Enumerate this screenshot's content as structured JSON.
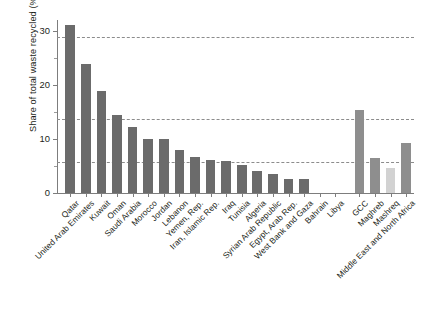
{
  "chart": {
    "type": "bar",
    "title": "",
    "xlabel": "",
    "ylabel": "Share of total waste recycled (%)",
    "ylim": [
      0,
      32
    ],
    "yticks": [
      "0",
      "10",
      "20",
      "30"
    ],
    "ytick_values": [
      0,
      10,
      20,
      30
    ],
    "ytick_minor_values": [
      5,
      15,
      25
    ],
    "grid": "horizontal-dashed",
    "gridline_values": [
      5.8,
      13.6,
      28.9
    ],
    "legend": "none",
    "colors": {
      "country_bar": "#6b6b6b",
      "aggregate_bar": "#8e8e8e",
      "aggregate_light_bar": "#d2d2d2",
      "axis": "#7d7d7d",
      "gridline": "#8c8c8c",
      "text": "#231f20"
    },
    "categories": [
      "Qatar",
      "United Arab Emirates",
      "Kuwait",
      "Oman",
      "Saudi Arabia",
      "Morocco",
      "Jordan",
      "Lebanon",
      "Yemen, Rep.",
      "Iran, Islamic Rep.",
      "Iraq",
      "Tunisia",
      "Algeria",
      "Syrian Arab Republic",
      "Egypt, Arab Rep.",
      "West Bank and Gaza",
      "Bahrain",
      "Libya",
      "GCC",
      "Maghreb",
      "Mashreq",
      "Middle East and North Africa"
    ],
    "values": [
      31.0,
      23.8,
      18.8,
      14.5,
      12.2,
      10.0,
      10.0,
      8.0,
      6.6,
      6.1,
      6.0,
      5.2,
      4.0,
      3.5,
      2.6,
      2.5,
      0.0,
      0.0,
      15.3,
      6.5,
      4.7,
      9.3
    ],
    "series_kind": [
      "country",
      "country",
      "country",
      "country",
      "country",
      "country",
      "country",
      "country",
      "country",
      "country",
      "country",
      "country",
      "country",
      "country",
      "country",
      "country",
      "country",
      "country",
      "aggregate",
      "aggregate",
      "aggregate-light",
      "aggregate"
    ]
  }
}
